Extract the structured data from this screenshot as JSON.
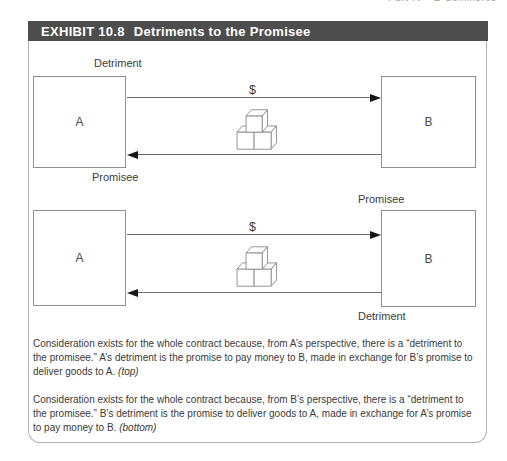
{
  "page": {
    "running_head": "Part IV • E-Commerce"
  },
  "exhibit": {
    "tag": "EXHIBIT 10.8",
    "title": "Detriments to the Promisee"
  },
  "diagrams": [
    {
      "name": "a-perspective",
      "party_a": "A",
      "party_b": "B",
      "money_label": "$",
      "goods_icon": "stacked-cubes",
      "top_label": "Detriment",
      "bottom_label": "Promisee"
    },
    {
      "name": "b-perspective",
      "party_a": "A",
      "party_b": "B",
      "money_label": "$",
      "goods_icon": "stacked-cubes",
      "top_label": "Promisee",
      "bottom_label": "Detriment"
    }
  ],
  "captions": [
    {
      "text": "Consideration exists for the whole contract because, from A’s perspective, there is a “detriment to the promisee.” A’s detriment is the promise to pay money to B, made in exchange for B’s promise to deliver goods to A.",
      "note": "(top)"
    },
    {
      "text": "Consideration exists for the whole contract because, from B’s perspective, there is a “detriment to the promisee.” B’s detriment is the promise to deliver goods to A, made in exchange for A’s promise to pay money to B.",
      "note": "(bottom)"
    }
  ],
  "colors": {
    "header_bar": "#4d4d4d",
    "header_text": "#ffffff",
    "frame_border": "#b3b3b3",
    "box_border": "#8f8f8f",
    "arrow_line": "#6e6e6e",
    "arrowhead": "#151515",
    "label_text": "#3c3c3c",
    "caption_text": "#3a3a3a"
  }
}
